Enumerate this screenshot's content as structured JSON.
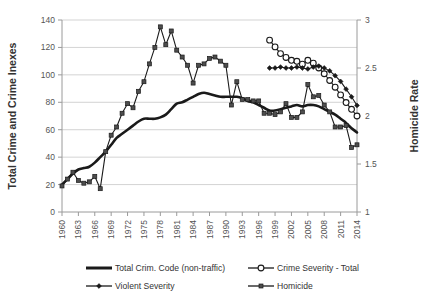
{
  "chart_data": {
    "type": "line",
    "title": "",
    "xlabel": "",
    "ylabel": "Total Crime and Crime Inexes",
    "y2label": "Homicide Rate",
    "ylim": [
      0,
      140
    ],
    "y2lim": [
      1,
      3
    ],
    "xlim": [
      1960,
      2014
    ],
    "grid": true,
    "legend_position": "bottom",
    "yticks": [
      "0",
      "20",
      "40",
      "60",
      "80",
      "100",
      "120",
      "140"
    ],
    "y2ticks": [
      "1",
      "1.5",
      "2",
      "2.5",
      "3"
    ],
    "xticks": [
      "1960",
      "1963",
      "1966",
      "1969",
      "1972",
      "1975",
      "1978",
      "1981",
      "1984",
      "1987",
      "1990",
      "1993",
      "1996",
      "1999",
      "2002",
      "2005",
      "2008",
      "2011",
      "2014"
    ],
    "x": [
      1960,
      1961,
      1962,
      1963,
      1964,
      1965,
      1966,
      1967,
      1968,
      1969,
      1970,
      1971,
      1972,
      1973,
      1974,
      1975,
      1976,
      1977,
      1978,
      1979,
      1980,
      1981,
      1982,
      1983,
      1984,
      1985,
      1986,
      1987,
      1988,
      1989,
      1990,
      1991,
      1992,
      1993,
      1994,
      1995,
      1996,
      1997,
      1998,
      1999,
      2000,
      2001,
      2002,
      2003,
      2004,
      2005,
      2006,
      2007,
      2008,
      2009,
      2010,
      2011,
      2012,
      2013,
      2014
    ],
    "series": [
      {
        "name": "Total Crim. Code  (non-traffic)",
        "axis": "left",
        "marker": "none",
        "style": "thick",
        "values": [
          20,
          24,
          28,
          31,
          32,
          33,
          36,
          40,
          44,
          49,
          54,
          57,
          60,
          63,
          66,
          68,
          68,
          68,
          69,
          71,
          75,
          79,
          80,
          82,
          84,
          86,
          87,
          86,
          85,
          84,
          84,
          84,
          84,
          83,
          81,
          80,
          78,
          76,
          74,
          74,
          75,
          76,
          77,
          78,
          77,
          78,
          78,
          77,
          75,
          73,
          71,
          68,
          65,
          61,
          58
        ]
      },
      {
        "name": "Crime Severity - Total",
        "axis": "right",
        "marker": "circle",
        "style": "thin",
        "values": [
          null,
          null,
          null,
          null,
          null,
          null,
          null,
          null,
          null,
          null,
          null,
          null,
          null,
          null,
          null,
          null,
          null,
          null,
          null,
          null,
          null,
          null,
          null,
          null,
          null,
          null,
          null,
          null,
          null,
          null,
          null,
          null,
          null,
          null,
          null,
          null,
          null,
          null,
          2.79,
          2.72,
          2.65,
          2.61,
          2.58,
          2.57,
          2.54,
          2.58,
          2.55,
          2.5,
          2.44,
          2.37,
          2.3,
          2.22,
          2.14,
          2.07,
          2.0
        ]
      },
      {
        "name": "Violent Severity",
        "axis": "right",
        "marker": "diamond",
        "style": "thin",
        "values": [
          null,
          null,
          null,
          null,
          null,
          null,
          null,
          null,
          null,
          null,
          null,
          null,
          null,
          null,
          null,
          null,
          null,
          null,
          null,
          null,
          null,
          null,
          null,
          null,
          null,
          null,
          null,
          null,
          null,
          null,
          null,
          null,
          null,
          null,
          null,
          null,
          null,
          null,
          2.5,
          2.5,
          2.51,
          2.5,
          2.5,
          2.51,
          2.5,
          2.49,
          2.51,
          2.52,
          2.5,
          2.47,
          2.42,
          2.36,
          2.28,
          2.2,
          2.11
        ]
      },
      {
        "name": "Homicide",
        "axis": "left",
        "marker": "square",
        "style": "thin",
        "values": [
          19,
          24,
          29,
          23,
          21,
          22,
          26,
          17,
          44,
          56,
          62,
          72,
          79,
          76,
          88,
          95,
          108,
          120,
          135,
          122,
          132,
          118,
          113,
          107,
          94,
          107,
          108,
          112,
          113,
          110,
          107,
          78,
          95,
          82,
          82,
          81,
          81,
          72,
          72,
          71,
          73,
          79,
          69,
          69,
          73,
          93,
          84,
          85,
          78,
          73,
          62,
          62,
          63,
          47,
          49
        ]
      }
    ]
  },
  "legend": {
    "items": [
      {
        "label": "Total Crim. Code  (non-traffic)",
        "marker": "none"
      },
      {
        "label": "Crime Severity - Total",
        "marker": "circle"
      },
      {
        "label": "Violent Severity",
        "marker": "diamond"
      },
      {
        "label": "Homicide",
        "marker": "square"
      }
    ]
  }
}
